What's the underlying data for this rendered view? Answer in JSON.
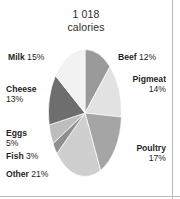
{
  "figure": {
    "title_value": "1 018",
    "title_unit": "calories"
  },
  "chart_data": {
    "type": "pie",
    "title": "1 018 calories",
    "subtitle": "",
    "xlabel": "",
    "ylabel": "",
    "units": "percent of calories",
    "total_label": "1 018",
    "total_unit": "calories",
    "legend_position": "callout-labels",
    "grid": false,
    "start_angle_deg": 0,
    "direction": "clockwise",
    "categories": [
      "Beef",
      "Pigmeat",
      "Poultry",
      "Other",
      "Fish",
      "Eggs",
      "Cheese",
      "Milk"
    ],
    "values": [
      12,
      14,
      17,
      21,
      3,
      5,
      13,
      15
    ],
    "colors": [
      "#9a9a9a",
      "#e2e2e2",
      "#a5a5a5",
      "#cfcfcf",
      "#8f8f8f",
      "#bdbdbd",
      "#6e6e6e",
      "#f2f2f2"
    ],
    "slices": [
      {
        "name": "Beef",
        "value": 12,
        "label_name": "Beef",
        "label_pct": "12%",
        "color": "#9a9a9a"
      },
      {
        "name": "Pigmeat",
        "value": 14,
        "label_name": "Pigmeat",
        "label_pct": "14%",
        "color": "#e2e2e2"
      },
      {
        "name": "Poultry",
        "value": 17,
        "label_name": "Poultry",
        "label_pct": "17%",
        "color": "#a5a5a5"
      },
      {
        "name": "Other",
        "value": 21,
        "label_name": "Other",
        "label_pct": "21%",
        "color": "#cfcfcf"
      },
      {
        "name": "Fish",
        "value": 3,
        "label_name": "Fish",
        "label_pct": "3%",
        "color": "#8f8f8f"
      },
      {
        "name": "Eggs",
        "value": 5,
        "label_name": "Eggs",
        "label_pct": "5%",
        "color": "#bdbdbd"
      },
      {
        "name": "Cheese",
        "value": 13,
        "label_name": "Cheese",
        "label_pct": "13%",
        "color": "#6e6e6e"
      },
      {
        "name": "Milk",
        "value": 15,
        "label_name": "Milk",
        "label_pct": "15%",
        "color": "#f2f2f2"
      }
    ]
  }
}
